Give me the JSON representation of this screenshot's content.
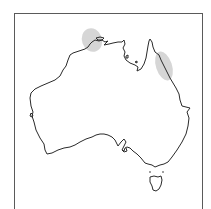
{
  "map": {
    "region": "Australia",
    "frame": true,
    "colors": {
      "coastline": "#2a2a2a",
      "distribution_shading": "#cfcfcf",
      "frame": "#5a5a5a",
      "background": "#ffffff"
    },
    "distribution_areas": [
      {
        "name": "Northern Territory (Arnhem Land / Top End)",
        "label": "Top End range"
      },
      {
        "name": "North-east Queensland (Wet Tropics)",
        "label": "NE Queensland range"
      }
    ]
  }
}
